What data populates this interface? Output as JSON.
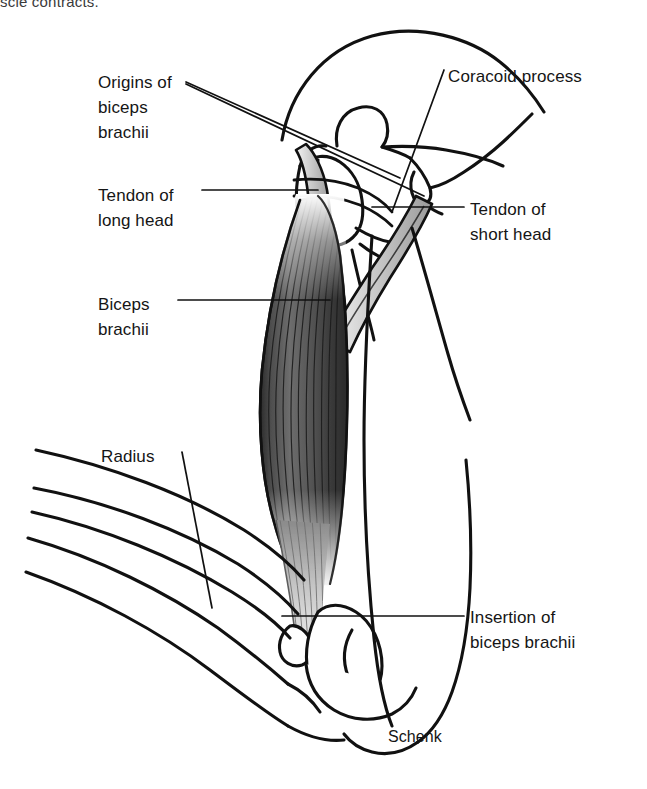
{
  "figure": {
    "signature": "Schenk",
    "partial_caption_above": "scle contracts.",
    "background_color": "#ffffff",
    "ink_color": "#111111"
  },
  "labels": [
    {
      "id": "origins-biceps-brachii",
      "text": "Origins of\nbiceps\nbrachii",
      "lines": [
        "Origins of",
        "biceps",
        "brachii"
      ],
      "x": 98,
      "y": 70,
      "align": "left",
      "leader": "double"
    },
    {
      "id": "coracoid-process",
      "text": "Coracoid process",
      "lines": [
        "Coracoid process"
      ],
      "x": 448,
      "y": 64,
      "align": "left",
      "leader": "single"
    },
    {
      "id": "tendon-long-head",
      "text": "Tendon of\nlong head",
      "lines": [
        "Tendon of",
        "long head"
      ],
      "x": 98,
      "y": 183,
      "align": "left",
      "leader": "single"
    },
    {
      "id": "tendon-short-head",
      "text": "Tendon of\nshort head",
      "lines": [
        "Tendon of",
        "short head"
      ],
      "x": 470,
      "y": 197,
      "align": "left",
      "leader": "single"
    },
    {
      "id": "biceps-brachii",
      "text": "Biceps\nbrachii",
      "lines": [
        "Biceps",
        "brachii"
      ],
      "x": 98,
      "y": 292,
      "align": "left",
      "leader": "single"
    },
    {
      "id": "radius",
      "text": "Radius",
      "lines": [
        "Radius"
      ],
      "x": 101,
      "y": 444,
      "align": "left",
      "leader": "single"
    },
    {
      "id": "insertion-biceps-brachii",
      "text": "Insertion of\nbiceps brachii",
      "lines": [
        "Insertion of",
        "biceps brachii"
      ],
      "x": 470,
      "y": 605,
      "align": "left",
      "leader": "single"
    }
  ],
  "anatomy_parts": [
    "scapula",
    "coracoid-process",
    "humerus",
    "humeral-head",
    "tendon-of-long-head",
    "tendon-of-short-head",
    "biceps-brachii-muscle-belly",
    "distal-biceps-tendon",
    "radius",
    "ulna",
    "arm-skin-contour",
    "forearm-contour"
  ]
}
